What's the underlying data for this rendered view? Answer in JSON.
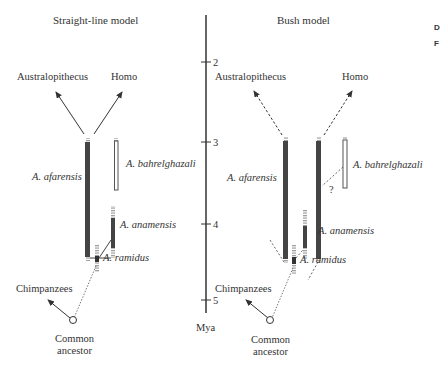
{
  "corner": {
    "line1": "D",
    "line2": "F"
  },
  "axis": {
    "unit_label": "Mya",
    "ticks": [
      "2",
      "3",
      "4",
      "5"
    ]
  },
  "straight_line_model": {
    "title": "Straight-line model",
    "labels": {
      "australopithecus": "Australopithecus",
      "homo": "Homo",
      "afarensis": "A. afarensis",
      "bahrelghazali": "A. bahrelghazali",
      "anamensis": "A. anamensis",
      "ramidus": "A. ramidus",
      "chimpanzees": "Chimpanzees",
      "common_ancestor_1": "Common",
      "common_ancestor_2": "ancestor"
    }
  },
  "bush_model": {
    "title": "Bush model",
    "labels": {
      "australopithecus": "Australopithecus",
      "homo": "Homo",
      "afarensis": "A. afarensis",
      "bahrelghazali": "A. bahrelghazali",
      "anamensis": "A. anamensis",
      "ramidus": "A. ramidus",
      "question": "?",
      "chimpanzees": "Chimpanzees",
      "common_ancestor_1": "Common",
      "common_ancestor_2": "ancestor"
    }
  },
  "colors": {
    "bar": "#444444",
    "line": "#333333",
    "faded": "#aaaaaa"
  }
}
